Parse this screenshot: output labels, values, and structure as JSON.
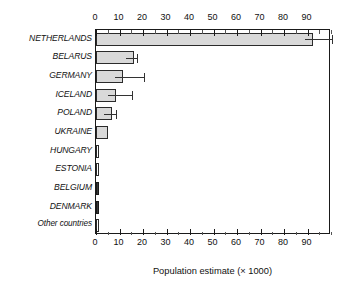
{
  "chart": {
    "type": "bar",
    "orientation": "horizontal",
    "title": "",
    "xlabel": "Population estimate (× 1000)",
    "ylabel": "",
    "xlim": [
      0,
      100
    ],
    "x_major_ticks": [
      0,
      10,
      20,
      30,
      40,
      50,
      60,
      70,
      80,
      90
    ],
    "x_minor_tick_step": 5,
    "top_axis": true,
    "bottom_axis": true,
    "grid": false,
    "legend": false,
    "bar_fill_color": "#d9d9d9",
    "bar_edge_color": "#2b2b2b",
    "dark_bar_color": "#3a3a3a",
    "error_bar_color": "#333333"
  },
  "chart_data": {
    "type": "bar",
    "title": "",
    "xlabel": "Population estimate (× 1000)",
    "ylabel": "",
    "xlim": [
      0,
      100
    ],
    "grid": false,
    "legend": false,
    "categories": [
      "NETHERLANDS",
      "BELARUS",
      "GERMANY",
      "ICELAND",
      "POLAND",
      "UKRAINE",
      "HUNGARY",
      "ESTONIA",
      "BELGIUM",
      "DENMARK",
      "Other countries"
    ],
    "values": [
      92.5,
      16,
      11.5,
      8.5,
      7,
      5,
      0.7,
      0.7,
      0.8,
      0.7,
      0.6
    ],
    "errors_high": [
      100.5,
      17.5,
      20.5,
      15.5,
      8.5,
      null,
      null,
      null,
      null,
      null,
      null
    ],
    "series": [
      {
        "name": "Population estimate",
        "values": [
          92.5,
          16,
          11.5,
          8.5,
          7,
          5,
          0.7,
          0.7,
          0.8,
          0.7,
          0.6
        ]
      }
    ],
    "tick_labels": [
      "0",
      "10",
      "20",
      "30",
      "40",
      "50",
      "60",
      "70",
      "80",
      "90"
    ],
    "annotations": []
  },
  "bars": [
    {
      "label": "NETHERLANDS",
      "value": 92.5,
      "err_high": 100.5,
      "style": "filled"
    },
    {
      "label": "BELARUS",
      "value": 16,
      "err_high": 17.5,
      "style": "filled"
    },
    {
      "label": "GERMANY",
      "value": 11.5,
      "err_high": 20.5,
      "style": "filled"
    },
    {
      "label": "ICELAND",
      "value": 8.5,
      "err_high": 15.5,
      "style": "filled"
    },
    {
      "label": "POLAND",
      "value": 7,
      "err_high": 8.5,
      "style": "filled"
    },
    {
      "label": "UKRAINE",
      "value": 5,
      "err_high": null,
      "style": "filled"
    },
    {
      "label": "HUNGARY",
      "value": 0.7,
      "err_high": null,
      "style": "hollow"
    },
    {
      "label": "ESTONIA",
      "value": 0.7,
      "err_high": null,
      "style": "hollow"
    },
    {
      "label": "BELGIUM",
      "value": 0.8,
      "err_high": null,
      "style": "dark"
    },
    {
      "label": "DENMARK",
      "value": 0.7,
      "err_high": null,
      "style": "dark"
    },
    {
      "label": "Other countries",
      "value": 0.6,
      "err_high": null,
      "style": "hollow"
    }
  ]
}
